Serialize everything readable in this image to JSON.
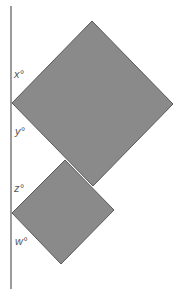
{
  "diagram": {
    "type": "geometry",
    "colors": {
      "background": "#ffffff",
      "square_fill": "#8a8a8a",
      "square_stroke": "#5a5a5a",
      "line": "#666666",
      "label": "#555555"
    },
    "line": {
      "x": 11,
      "y1": 6,
      "y2": 289
    },
    "squares": [
      {
        "name": "large",
        "points": "12,103 92,21 173,104 93,186"
      },
      {
        "name": "small",
        "points": "12,213 65,160 114,210 61,264"
      }
    ],
    "labels": [
      {
        "id": "x",
        "text": "x°",
        "x": 14,
        "y": 78
      },
      {
        "id": "y",
        "text": "y°",
        "x": 15,
        "y": 135
      },
      {
        "id": "z",
        "text": "z°",
        "x": 14,
        "y": 192
      },
      {
        "id": "w",
        "text": "w°",
        "x": 15,
        "y": 245
      }
    ]
  }
}
